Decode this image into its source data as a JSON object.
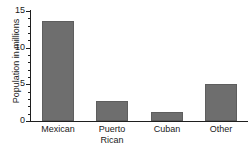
{
  "chart_data": {
    "type": "bar",
    "title": "",
    "xlabel": "",
    "ylabel": "Population in millions",
    "categories": [
      "Mexican",
      "Puerto Rican",
      "Cuban",
      "Other"
    ],
    "category_lines": [
      [
        "Mexican"
      ],
      [
        "Puerto",
        "Rican"
      ],
      [
        "Cuban"
      ],
      [
        "Other"
      ]
    ],
    "values": [
      13.7,
      2.7,
      1.2,
      5.1
    ],
    "ylim": [
      0,
      15
    ],
    "y_ticks_major": [
      0,
      5,
      10,
      15
    ],
    "y_tick_labels": [
      "0",
      "5",
      "10",
      "15"
    ],
    "y_minor_tick_step": 1,
    "grid": false,
    "legend": "none",
    "bar_color": "#6e6e6e",
    "axis_color": "#1f1f1f",
    "text_color": "#1a1a1a",
    "background": "#ffffff"
  }
}
